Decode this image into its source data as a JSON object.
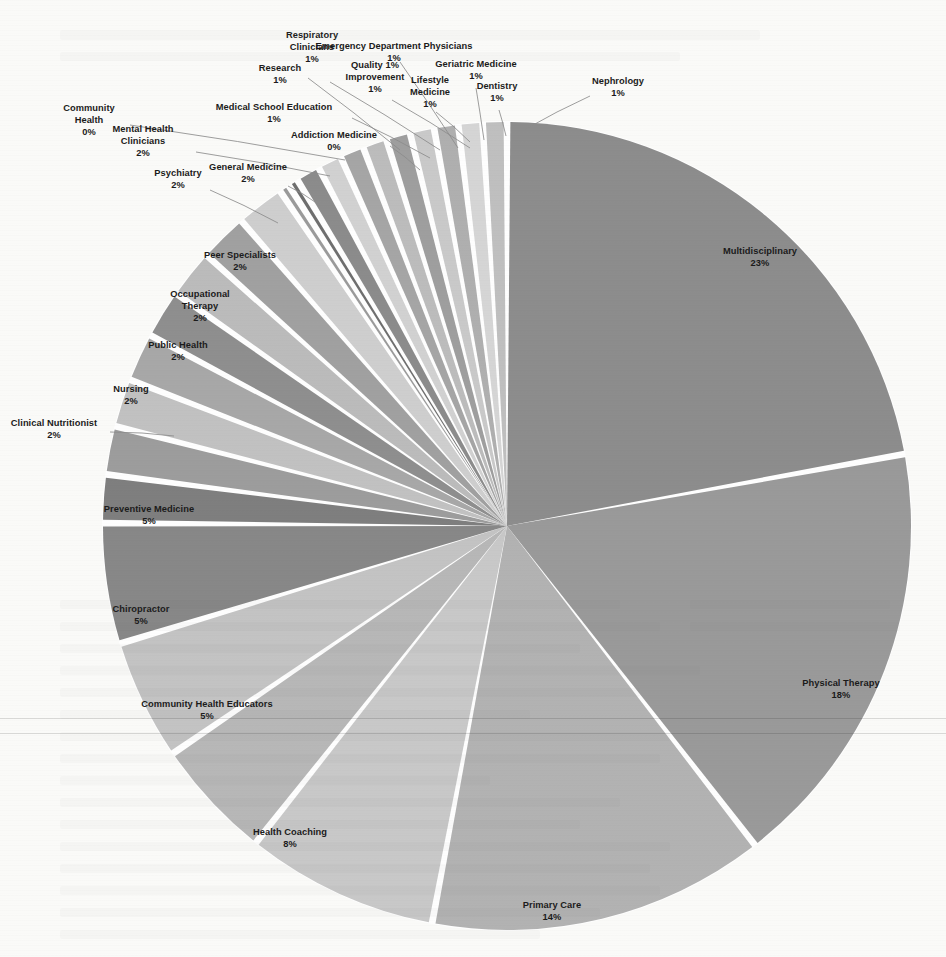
{
  "chart_data": {
    "type": "pie",
    "title": "",
    "subtitle": "",
    "xlabel": "",
    "ylabel": "",
    "legend_position": "none",
    "grid": false,
    "label_format": "name + percent",
    "start_angle_deg": 0,
    "direction": "clockwise",
    "total_percent": 100,
    "categories": [
      "Multidisciplinary",
      "Physical Therapy",
      "Primary Care",
      "Health Coaching",
      "Community Health Educators",
      "Chiropractor",
      "Preventive Medicine",
      "Clinical Nutritionist",
      "Nursing",
      "Public Health",
      "Occupational Therapy",
      "Peer Specialists",
      "Psychiatry",
      "General Medicine",
      "Mental Health Clinicians",
      "Community Health",
      "Addiction Medicine",
      "Medical School Education",
      "Research",
      "Respiratory Clinicians",
      "Emergency Department Physicians",
      "Quality Improvement",
      "Geriatric Medicine",
      "Lifestyle Medicine",
      "Dentistry",
      "Nephrology"
    ],
    "values": [
      23,
      18,
      14,
      8,
      5,
      5,
      5,
      2,
      2,
      2,
      2,
      2,
      2,
      2,
      2,
      0,
      0,
      1,
      1,
      1,
      1,
      1,
      1,
      1,
      1,
      1
    ],
    "value_labels": [
      "23%",
      "18%",
      "14%",
      "8%",
      "5%",
      "5%",
      "5%",
      "2%",
      "2%",
      "2%",
      "2%",
      "2%",
      "2%",
      "2%",
      "2%",
      "0%",
      "0%",
      "1%",
      "1%",
      "1%",
      "1%",
      "1%",
      "1%",
      "1%",
      "1%",
      "1%"
    ],
    "colors": [
      "#8d8d8d",
      "#9a9a9a",
      "#b3b3b3",
      "#c9c9c9",
      "#b8b8b8",
      "#c4c4c4",
      "#888888",
      "#7f7f7f",
      "#9d9d9d",
      "#c2c2c2",
      "#a8a8a8",
      "#8f8f8f",
      "#bcbcbc",
      "#a1a1a1",
      "#cfcfcf",
      "#9b9b9b",
      "#6f6f6f",
      "#8c8c8c",
      "#d2d2d2",
      "#a6a6a6",
      "#bdbdbd",
      "#9f9f9f",
      "#cacaca",
      "#b0b0b0",
      "#d6d6d6",
      "#c0c0c0"
    ],
    "slices": [
      {
        "name": "Multidisciplinary",
        "percent": 23,
        "label": "Multidisciplinary",
        "value_label": "23%",
        "color": "#8d8d8d",
        "placement": "inside"
      },
      {
        "name": "Physical Therapy",
        "percent": 18,
        "label": "Physical Therapy",
        "value_label": "18%",
        "color": "#9a9a9a",
        "placement": "inside"
      },
      {
        "name": "Primary Care",
        "percent": 14,
        "label": "Primary Care",
        "value_label": "14%",
        "color": "#b3b3b3",
        "placement": "inside"
      },
      {
        "name": "Health Coaching",
        "percent": 8,
        "label": "Health Coaching",
        "value_label": "8%",
        "color": "#c9c9c9",
        "placement": "inside"
      },
      {
        "name": "Community Health Educators",
        "percent": 5,
        "label": "Community Health Educators",
        "value_label": "5%",
        "color": "#b8b8b8",
        "placement": "inside"
      },
      {
        "name": "Chiropractor",
        "percent": 5,
        "label": "Chiropractor",
        "value_label": "5%",
        "color": "#c4c4c4",
        "placement": "inside"
      },
      {
        "name": "Preventive Medicine",
        "percent": 5,
        "label": "Preventive Medicine",
        "value_label": "5%",
        "color": "#888888",
        "placement": "inside"
      },
      {
        "name": "Clinical Nutritionist",
        "percent": 2,
        "label": "Clinical Nutritionist",
        "value_label": "2%",
        "color": "#7f7f7f",
        "placement": "outside"
      },
      {
        "name": "Nursing",
        "percent": 2,
        "label": "Nursing",
        "value_label": "2%",
        "color": "#9d9d9d",
        "placement": "inside"
      },
      {
        "name": "Public Health",
        "percent": 2,
        "label": "Public Health",
        "value_label": "2%",
        "color": "#c2c2c2",
        "placement": "inside"
      },
      {
        "name": "Occupational Therapy",
        "percent": 2,
        "label": "Occupational Therapy",
        "value_label": "2%",
        "color": "#a8a8a8",
        "placement": "inside"
      },
      {
        "name": "Peer Specialists",
        "percent": 2,
        "label": "Peer Specialists",
        "value_label": "2%",
        "color": "#8f8f8f",
        "placement": "inside"
      },
      {
        "name": "Psychiatry",
        "percent": 2,
        "label": "Psychiatry",
        "value_label": "2%",
        "color": "#bcbcbc",
        "placement": "outside"
      },
      {
        "name": "General Medicine",
        "percent": 2,
        "label": "General Medicine",
        "value_label": "2%",
        "color": "#a1a1a1",
        "placement": "outside"
      },
      {
        "name": "Mental Health Clinicians",
        "percent": 2,
        "label": "Mental Health Clinicians",
        "value_label": "2%",
        "color": "#cfcfcf",
        "placement": "outside"
      },
      {
        "name": "Community Health",
        "percent": 0,
        "label": "Community Health",
        "value_label": "0%",
        "color": "#9b9b9b",
        "placement": "outside"
      },
      {
        "name": "Addiction Medicine",
        "percent": 0,
        "label": "Addiction Medicine",
        "value_label": "0%",
        "color": "#6f6f6f",
        "placement": "outside"
      },
      {
        "name": "Medical School Education",
        "percent": 1,
        "label": "Medical School Education",
        "value_label": "1%",
        "color": "#8c8c8c",
        "placement": "outside"
      },
      {
        "name": "Research",
        "percent": 1,
        "label": "Research",
        "value_label": "1%",
        "color": "#d2d2d2",
        "placement": "outside"
      },
      {
        "name": "Respiratory Clinicians",
        "percent": 1,
        "label": "Respiratory Clinicians",
        "value_label": "1%",
        "color": "#a6a6a6",
        "placement": "outside"
      },
      {
        "name": "Emergency Department Physicians",
        "percent": 1,
        "label": "Emergency Department Physicians",
        "value_label": "1%",
        "color": "#bdbdbd",
        "placement": "outside"
      },
      {
        "name": "Quality Improvement",
        "percent": 1,
        "label": "Quality Improvement",
        "value_label": "1%",
        "color": "#9f9f9f",
        "placement": "outside"
      },
      {
        "name": "Geriatric Medicine",
        "percent": 1,
        "label": "Geriatric Medicine",
        "value_label": "1%",
        "color": "#cacaca",
        "placement": "outside"
      },
      {
        "name": "Lifestyle Medicine",
        "percent": 1,
        "label": "Lifestyle Medicine",
        "value_label": "1%",
        "color": "#b0b0b0",
        "placement": "outside"
      },
      {
        "name": "Dentistry",
        "percent": 1,
        "label": "Dentistry",
        "value_label": "1%",
        "color": "#d6d6d6",
        "placement": "outside"
      },
      {
        "name": "Nephrology",
        "percent": 1,
        "label": "Nephrology",
        "value_label": "1%",
        "color": "#c0c0c0",
        "placement": "outside"
      }
    ]
  },
  "geometry": {
    "center_x": 507,
    "center_y": 526,
    "radius": 404
  },
  "style": {
    "background": "#fbfbf9",
    "label_color": "#1b1b1b",
    "leader_color": "#8d8d8d",
    "slice_gap_color": "#ffffff"
  },
  "label_layout": [
    {
      "name": "Multidisciplinary",
      "lx": 760,
      "ly": 258,
      "lines": [
        "Multidisciplinary",
        "23%"
      ],
      "leader": null
    },
    {
      "name": "Physical Therapy",
      "lx": 841,
      "ly": 690,
      "lines": [
        "Physical Therapy",
        "18%"
      ],
      "leader": null
    },
    {
      "name": "Primary Care",
      "lx": 552,
      "ly": 912,
      "lines": [
        "Primary Care",
        "14%"
      ],
      "leader": null
    },
    {
      "name": "Health Coaching",
      "lx": 290,
      "ly": 839,
      "lines": [
        "Health Coaching",
        "8%"
      ],
      "leader": null
    },
    {
      "name": "Community Health Educators",
      "lx": 207,
      "ly": 711,
      "lines": [
        "Community Health Educators",
        "5%"
      ],
      "leader": null
    },
    {
      "name": "Chiropractor",
      "lx": 141,
      "ly": 616,
      "lines": [
        "Chiropractor",
        "5%"
      ],
      "leader": null
    },
    {
      "name": "Preventive Medicine",
      "lx": 149,
      "ly": 516,
      "lines": [
        "Preventive Medicine",
        "5%"
      ],
      "leader": null
    },
    {
      "name": "Clinical Nutritionist",
      "lx": 54,
      "ly": 430,
      "lines": [
        "Clinical Nutritionist",
        "2%"
      ],
      "leader": [
        [
          110,
          432
        ],
        [
          174,
          436
        ]
      ]
    },
    {
      "name": "Nursing",
      "lx": 131,
      "ly": 396,
      "lines": [
        "Nursing",
        "2%"
      ],
      "leader": null
    },
    {
      "name": "Public Health",
      "lx": 178,
      "ly": 352,
      "lines": [
        "Public Health",
        "2%"
      ],
      "leader": null
    },
    {
      "name": "Occupational Therapy",
      "lx": 200,
      "ly": 307,
      "lines": [
        "Occupational",
        "Therapy",
        "2%"
      ],
      "leader": null
    },
    {
      "name": "Peer Specialists",
      "lx": 240,
      "ly": 262,
      "lines": [
        "Peer Specialists",
        "2%"
      ],
      "leader": null
    },
    {
      "name": "Psychiatry",
      "lx": 178,
      "ly": 180,
      "lines": [
        "Psychiatry",
        "2%"
      ],
      "leader": [
        [
          210,
          190
        ],
        [
          278,
          223
        ]
      ]
    },
    {
      "name": "General Medicine",
      "lx": 248,
      "ly": 174,
      "lines": [
        "General Medicine",
        "2%"
      ],
      "leader": [
        [
          288,
          186
        ],
        [
          318,
          204
        ]
      ]
    },
    {
      "name": "Mental Health Clinicians",
      "lx": 143,
      "ly": 142,
      "lines": [
        "Mental Health",
        "Clinicians",
        "2%"
      ],
      "leader": [
        [
          196,
          152
        ],
        [
          330,
          176
        ]
      ]
    },
    {
      "name": "Community Health",
      "lx": 89,
      "ly": 121,
      "lines": [
        "Community",
        "Health",
        "0%"
      ],
      "leader": [
        [
          130,
          125
        ],
        [
          345,
          160
        ]
      ]
    },
    {
      "name": "Addiction Medicine",
      "lx": 334,
      "ly": 142,
      "lines": [
        "Addiction Medicine",
        "0%"
      ],
      "leader": [
        [
          390,
          146
        ],
        [
          420,
          170
        ]
      ]
    },
    {
      "name": "Medical School Education",
      "lx": 274,
      "ly": 114,
      "lines": [
        "Medical School Education",
        "1%"
      ],
      "leader": [
        [
          352,
          118
        ],
        [
          430,
          158
        ]
      ]
    },
    {
      "name": "Research",
      "lx": 280,
      "ly": 75,
      "lines": [
        "Research",
        "1%"
      ],
      "leader": [
        [
          308,
          78
        ],
        [
          400,
          150
        ]
      ]
    },
    {
      "name": "Respiratory Clinicians",
      "lx": 312,
      "ly": 48,
      "lines": [
        "Respiratory",
        "Clinicians",
        "1%"
      ],
      "leader": [
        [
          330,
          82
        ],
        [
          440,
          150
        ]
      ]
    },
    {
      "name": "Emergency Department Physicians",
      "lx": 394,
      "ly": 53,
      "lines": [
        "Emergency Department Physicians",
        "1%"
      ],
      "leader": [
        [
          400,
          62
        ],
        [
          458,
          148
        ]
      ]
    },
    {
      "name": "Quality Improvement",
      "lx": 375,
      "ly": 78,
      "lines": [
        "Quality 1%",
        "Improvement",
        "1%"
      ],
      "leader": [
        [
          392,
          100
        ],
        [
          470,
          148
        ]
      ]
    },
    {
      "name": "Geriatric Medicine",
      "lx": 476,
      "ly": 71,
      "lines": [
        "Geriatric Medicine",
        "1%"
      ],
      "leader": [
        [
          476,
          88
        ],
        [
          484,
          140
        ]
      ]
    },
    {
      "name": "Lifestyle Medicine",
      "lx": 430,
      "ly": 93,
      "lines": [
        "Lifestyle",
        "Medicine",
        "1%"
      ],
      "leader": [
        [
          436,
          112
        ],
        [
          470,
          142
        ]
      ]
    },
    {
      "name": "Dentistry",
      "lx": 497,
      "ly": 93,
      "lines": [
        "Dentistry",
        "1%"
      ],
      "leader": [
        [
          499,
          110
        ],
        [
          506,
          136
        ]
      ]
    },
    {
      "name": "Nephrology",
      "lx": 618,
      "ly": 88,
      "lines": [
        "Nephrology",
        "1%"
      ],
      "leader": [
        [
          590,
          96
        ],
        [
          524,
          130
        ]
      ]
    }
  ]
}
